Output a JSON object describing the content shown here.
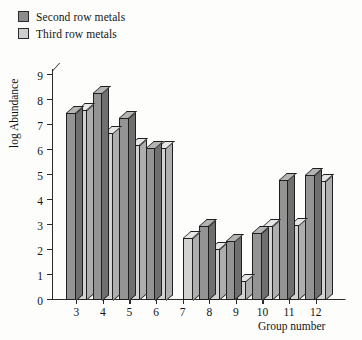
{
  "legend": {
    "items": [
      {
        "label": "Second row metals",
        "color": "#949494",
        "key": "second_row"
      },
      {
        "label": "Third row metals",
        "color": "#d2d2d2",
        "key": "third_row"
      }
    ]
  },
  "chart_data": {
    "type": "bar",
    "title": "",
    "xlabel": "Group number",
    "ylabel": "log Abundance",
    "categories": [
      "3",
      "4",
      "5",
      "6",
      "7",
      "8",
      "9",
      "10",
      "11",
      "12"
    ],
    "series": [
      {
        "name": "Second row metals",
        "color": "#949494",
        "values": [
          7.5,
          8.3,
          7.3,
          6.1,
          null,
          2.95,
          2.35,
          2.7,
          4.8,
          5.0
        ]
      },
      {
        "name": "Third row metals",
        "color": "#d2d2d2",
        "values": [
          7.6,
          6.7,
          6.2,
          6.1,
          2.5,
          2.05,
          0.75,
          2.95,
          3.0,
          4.75
        ]
      }
    ],
    "ylim": [
      0,
      9
    ],
    "yticks": [
      "0",
      "1",
      "2",
      "3",
      "4",
      "5",
      "6",
      "7",
      "8",
      "9"
    ],
    "xticks": [
      "3",
      "4",
      "5",
      "6",
      "7",
      "8",
      "9",
      "10",
      "11",
      "12"
    ],
    "grid": false,
    "legend_position": "top-left"
  }
}
